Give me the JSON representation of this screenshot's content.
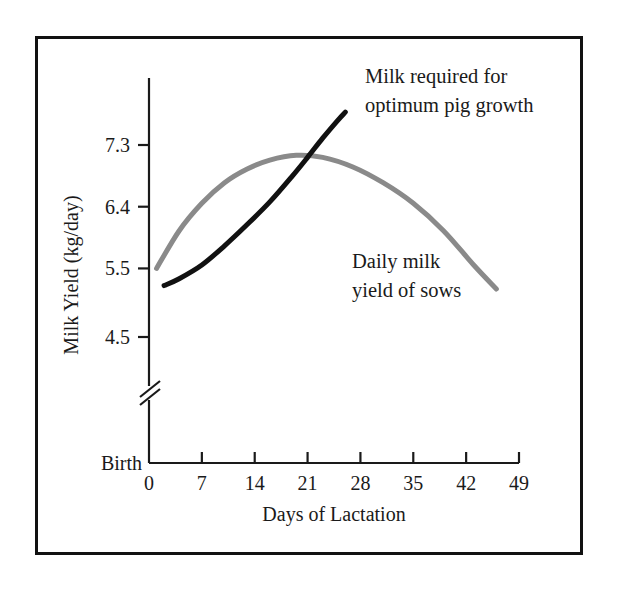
{
  "figure": {
    "background_color": "#ffffff",
    "border_color": "#111111"
  },
  "chart_data": {
    "type": "line",
    "title": "",
    "subtitle": "",
    "xlabel": "Days of Lactation",
    "ylabel": "Milk Yield (kg/day)",
    "xlim": [
      0,
      49
    ],
    "ylim": [
      4.5,
      7.75
    ],
    "xticks": [
      0,
      7,
      14,
      21,
      28,
      35,
      42,
      49
    ],
    "xtick_labels": [
      "0",
      "7",
      "14",
      "21",
      "28",
      "35",
      "42",
      "49"
    ],
    "yticks": [
      4.5,
      5.5,
      6.4,
      7.3
    ],
    "ytick_labels": [
      "4.5",
      "5.5",
      "6.4",
      "7.3"
    ],
    "origin_label": "Birth",
    "y_axis_break": true,
    "grid": false,
    "legend_position": "inline-annotations",
    "series": [
      {
        "name": "Milk required for optimum pig growth",
        "color": "#111111",
        "linewidth": 5,
        "annotation": "Milk required for optimum pig growth",
        "annotation_lines": [
          "Milk required for",
          "optimum pig growth"
        ],
        "x": [
          2,
          4,
          7,
          10,
          13,
          16,
          19,
          21,
          23,
          25,
          26
        ],
        "y": [
          5.25,
          5.35,
          5.55,
          5.83,
          6.14,
          6.47,
          6.85,
          7.12,
          7.4,
          7.66,
          7.78
        ]
      },
      {
        "name": "Daily milk yield of sows",
        "color": "#8a8a8a",
        "linewidth": 5,
        "annotation": "Daily milk yield of sows",
        "annotation_lines": [
          "Daily milk",
          "yield of sows"
        ],
        "x": [
          1,
          4,
          7,
          10,
          13,
          16,
          19.5,
          23,
          27,
          31,
          35,
          39,
          43,
          46
        ],
        "y": [
          5.5,
          6.05,
          6.45,
          6.75,
          6.95,
          7.08,
          7.15,
          7.12,
          6.98,
          6.75,
          6.45,
          6.05,
          5.55,
          5.2
        ]
      }
    ]
  },
  "annotations": {
    "series_black_line1": "Milk required for",
    "series_black_line2": "optimum pig growth",
    "series_gray_line1": "Daily milk",
    "series_gray_line2": "yield of sows"
  },
  "axes": {
    "y_title": "Milk Yield (kg/day)",
    "x_title": "Days of Lactation",
    "origin_label": "Birth",
    "y_labels": [
      "7.3",
      "6.4",
      "5.5",
      "4.5"
    ],
    "x_labels": [
      "0",
      "7",
      "14",
      "21",
      "28",
      "35",
      "42",
      "49"
    ]
  }
}
